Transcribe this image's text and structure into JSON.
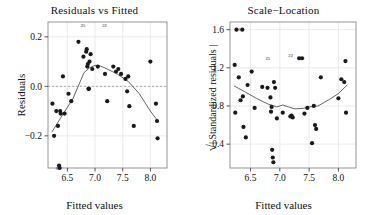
{
  "figure": {
    "width": 378,
    "height": 215,
    "background": "#ffffff",
    "point_color": "#1a1a1a",
    "line_color": "#555555",
    "grid_color": "#e9e4e4",
    "frame_color": "#8a8a8a"
  },
  "panels": [
    {
      "id": "residuals-vs-fitted",
      "title": "Residuals vs Fitted",
      "xlabel": "Fitted values",
      "ylabel": "Residuals"
    },
    {
      "id": "scale-location",
      "title": "Scale−Location",
      "xlabel": "Fitted values",
      "ylabel_prefix": "√",
      "ylabel": "| Standardized residuals |"
    }
  ],
  "chart_data": [
    {
      "type": "scatter",
      "id": "residuals-vs-fitted",
      "title": "Residuals vs Fitted",
      "xlabel": "Fitted values",
      "ylabel": "Residuals",
      "xlim": [
        6.15,
        8.3
      ],
      "ylim": [
        -0.33,
        0.26
      ],
      "xticks": [
        6.5,
        7.0,
        7.5,
        8.0
      ],
      "xticklabels": [
        "6.5",
        "7.0",
        "7.5",
        "8.0"
      ],
      "yticks": [
        -0.2,
        0.0,
        0.2
      ],
      "yticklabels": [
        "−0.2",
        "0.0",
        "0.2"
      ],
      "grid": true,
      "legend": "none",
      "reference_line": {
        "y": 0.0,
        "style": "dashed"
      },
      "x": [
        6.23,
        6.26,
        6.3,
        6.33,
        6.35,
        6.36,
        6.37,
        6.38,
        6.42,
        6.45,
        6.52,
        6.57,
        6.7,
        6.79,
        6.84,
        6.85,
        6.86,
        6.87,
        6.88,
        6.89,
        6.9,
        6.92,
        6.95,
        7.05,
        7.18,
        7.22,
        7.33,
        7.38,
        7.42,
        7.47,
        7.55,
        7.58,
        7.6,
        7.62,
        7.7,
        8.0,
        8.1,
        8.12,
        8.13
      ],
      "y": [
        -0.07,
        -0.2,
        -0.1,
        -0.16,
        -0.32,
        -0.33,
        -0.1,
        -0.11,
        0.04,
        -0.11,
        -0.03,
        -0.06,
        0.18,
        0.12,
        0.14,
        0.15,
        0.08,
        0.09,
        -0.01,
        -0.01,
        0.1,
        0.13,
        0.07,
        0.08,
        0.05,
        -0.06,
        0.08,
        0.06,
        0.07,
        0.05,
        0.03,
        -0.02,
        0.04,
        -0.08,
        -0.16,
        0.1,
        -0.07,
        -0.14,
        -0.21
      ],
      "smoother": {
        "type": "loess",
        "x": [
          6.22,
          6.4,
          6.6,
          6.8,
          6.9,
          7.0,
          7.1,
          7.2,
          7.4,
          7.6,
          7.8,
          8.0,
          8.15
        ],
        "y": [
          -0.185,
          -0.12,
          -0.05,
          0.055,
          0.075,
          0.085,
          0.082,
          0.072,
          0.05,
          0.02,
          -0.03,
          -0.1,
          -0.145
        ]
      },
      "point_labels": [
        {
          "text": "25",
          "x": 6.85,
          "y": 0.245
        },
        {
          "text": "22",
          "x": 7.24,
          "y": 0.245
        },
        {
          "text": "6",
          "x": 6.36,
          "y": -0.33
        }
      ]
    },
    {
      "type": "scatter",
      "id": "scale-location",
      "title": "Scale−Location",
      "xlabel": "Fitted values",
      "ylabel": "√| Standardized residuals |",
      "xlim": [
        6.15,
        8.3
      ],
      "ylim": [
        0.15,
        1.68
      ],
      "xticks": [
        6.5,
        7.0,
        7.5,
        8.0
      ],
      "xticklabels": [
        "6.5",
        "7.0",
        "7.5",
        "8.0"
      ],
      "yticks": [
        0.4,
        0.8,
        1.2,
        1.6
      ],
      "yticklabels": [
        "0.4",
        "0.8",
        "1.2",
        "1.6"
      ],
      "grid": true,
      "legend": "none",
      "x": [
        6.23,
        6.24,
        6.26,
        6.3,
        6.33,
        6.36,
        6.37,
        6.38,
        6.42,
        6.45,
        6.52,
        6.57,
        6.7,
        6.79,
        6.84,
        6.85,
        6.86,
        6.87,
        6.88,
        6.89,
        6.9,
        6.92,
        6.95,
        7.05,
        7.18,
        7.2,
        7.22,
        7.33,
        7.38,
        7.42,
        7.47,
        7.55,
        7.58,
        7.6,
        7.62,
        7.7,
        8.0,
        8.05,
        8.1,
        8.12,
        8.13
      ],
      "y": [
        1.23,
        0.73,
        1.6,
        1.1,
        0.86,
        1.6,
        0.9,
        0.58,
        0.47,
        1.02,
        1.16,
        0.78,
        1.0,
        0.99,
        0.89,
        0.74,
        0.79,
        0.34,
        0.26,
        0.21,
        1.05,
        0.99,
        0.67,
        0.73,
        0.69,
        0.7,
        0.68,
        1.3,
        1.3,
        0.72,
        0.78,
        0.41,
        0.8,
        0.6,
        0.56,
        1.1,
        0.88,
        1.08,
        1.05,
        1.27,
        0.73
      ],
      "smoother": {
        "type": "loess",
        "x": [
          6.22,
          6.4,
          6.6,
          6.8,
          6.95,
          7.05,
          7.15,
          7.25,
          7.4,
          7.5,
          7.65,
          7.85,
          8.0,
          8.15
        ],
        "y": [
          1.01,
          0.95,
          0.88,
          0.82,
          0.79,
          0.81,
          0.79,
          0.77,
          0.775,
          0.79,
          0.8,
          0.87,
          0.93,
          1.02
        ]
      },
      "point_labels": [
        {
          "text": "25",
          "x": 6.86,
          "y": 1.3
        },
        {
          "text": "22",
          "x": 7.25,
          "y": 1.33
        },
        {
          "text": "6",
          "x": 6.36,
          "y": 1.6
        }
      ]
    }
  ]
}
